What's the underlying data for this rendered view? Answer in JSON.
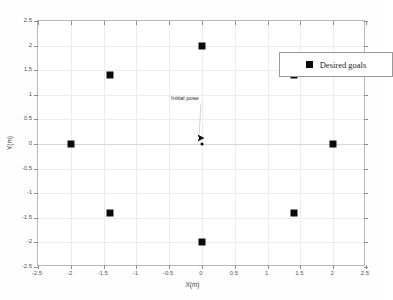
{
  "chart_data": {
    "type": "scatter",
    "title": "",
    "xlabel": "X(m)",
    "ylabel": "Y(m)",
    "xlim": [
      -2.5,
      2.5
    ],
    "ylim": [
      -2.5,
      2.5
    ],
    "xticks": [
      "-2.5",
      "-2",
      "-1.5",
      "-1",
      "-0.5",
      "0",
      "0.5",
      "1",
      "1.5",
      "2",
      "2.5"
    ],
    "xtick_values": [
      -2.5,
      -2,
      -1.5,
      -1,
      -0.5,
      0,
      0.5,
      1,
      1.5,
      2,
      2.5
    ],
    "yticks": [
      "-2.5",
      "-2",
      "-1.5",
      "-1",
      "-0.5",
      "0",
      "0.5",
      "1",
      "1.5",
      "2",
      "2.5"
    ],
    "ytick_values": [
      -2.5,
      -2,
      -1.5,
      -1,
      -0.5,
      0,
      0.5,
      1,
      1.5,
      2,
      2.5
    ],
    "grid": true,
    "legend_position": "top-right",
    "series": [
      {
        "name": "Desired goals",
        "marker": "square",
        "color": "#0a0a0a",
        "points": [
          {
            "x": 0,
            "y": 2
          },
          {
            "x": 1.41,
            "y": 1.41
          },
          {
            "x": 2,
            "y": 0
          },
          {
            "x": 1.41,
            "y": -1.41
          },
          {
            "x": 0,
            "y": -2
          },
          {
            "x": -1.41,
            "y": -1.41
          },
          {
            "x": -2,
            "y": 0
          },
          {
            "x": -1.41,
            "y": 1.41
          }
        ]
      }
    ],
    "annotations": [
      {
        "text": "Initial pose",
        "text_x": -0.26,
        "text_y": 0.93,
        "point_x": 0,
        "point_y": 0.12
      }
    ],
    "origin_marker": {
      "x": 0,
      "y": 0,
      "shape": "dot"
    }
  },
  "legend": {
    "entries": [
      {
        "label": "Desired goals",
        "swatch": "black-square"
      }
    ]
  },
  "axes": {
    "x_title": "X(m)",
    "y_title": "Y(m)"
  }
}
